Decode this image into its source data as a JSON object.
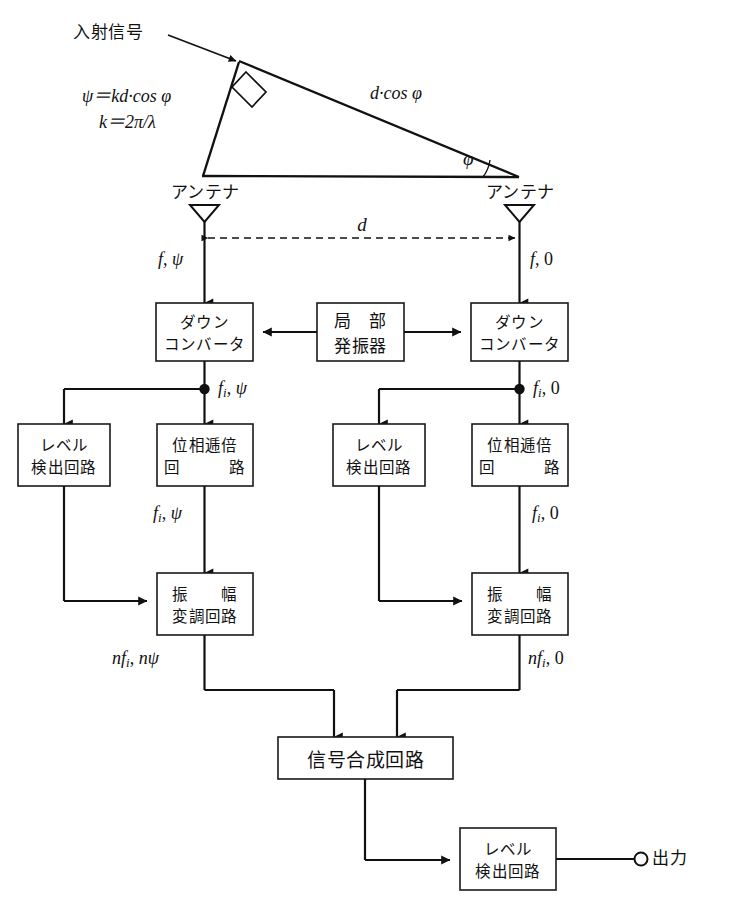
{
  "figure": {
    "incident_signal_label": "入射信号",
    "antenna_label_left": "アンテナ",
    "antenna_label_right": "アンテナ",
    "formula_psi": "ψ＝kd·cos φ",
    "formula_k": "k＝2π/λ",
    "path_difference_label": "d·cos φ",
    "angle_label": "φ",
    "spacing_label": "d",
    "output_label": "出力"
  },
  "signal_labels": {
    "antenna_out_left": {
      "freq": "f",
      "comma": ", ",
      "phase": "ψ"
    },
    "antenna_out_right": {
      "freq": "f",
      "comma": ", ",
      "phase": "0"
    },
    "if_left": {
      "freq": "f",
      "sub": "i",
      "comma": ", ",
      "phase": "ψ"
    },
    "if_right": {
      "freq": "f",
      "sub": "i",
      "comma": ", ",
      "phase": "0"
    },
    "mult_out_left": {
      "freq": "f",
      "sub": "i",
      "comma": ", ",
      "phase": "ψ"
    },
    "mult_out_right": {
      "freq": "f",
      "sub": "i",
      "comma": ", ",
      "phase": "0"
    },
    "mod_out_left": {
      "pre": "n",
      "freq": "f",
      "sub": "i",
      "comma": ", ",
      "phase": "nψ"
    },
    "mod_out_right": {
      "pre": "n",
      "freq": "f",
      "sub": "i",
      "comma": ", ",
      "phase": "0"
    }
  },
  "boxes": {
    "down_converter_left": {
      "line1": "ダウン",
      "line2": "コンバータ"
    },
    "down_converter_right": {
      "line1": "ダウン",
      "line2": "コンバータ"
    },
    "local_oscillator": {
      "line1": "局　部",
      "line2": "発振器"
    },
    "level_detect_left": {
      "line1": "レベル",
      "line2": "検出回路"
    },
    "level_detect_right": {
      "line1": "レベル",
      "line2": "検出回路"
    },
    "phase_multiplier_left": {
      "line1": "位相逓倍",
      "line2": "回　　　路"
    },
    "phase_multiplier_right": {
      "line1": "位相逓倍",
      "line2": "回　　　路"
    },
    "amp_modulator_left": {
      "line1": "振　　幅",
      "line2": "変調回路"
    },
    "amp_modulator_right": {
      "line1": "振　　幅",
      "line2": "変調回路"
    },
    "signal_combiner": {
      "line1": "信号合成回路"
    },
    "level_detect_output": {
      "line1": "レベル",
      "line2": "検出回路"
    }
  },
  "colors": {
    "line": "#111111",
    "box_fill": "#ffffff",
    "background": "#ffffff"
  }
}
